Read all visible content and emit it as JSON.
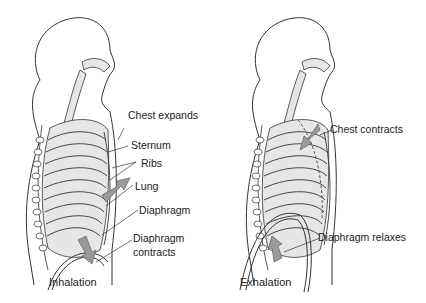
{
  "panels": [
    {
      "caption": "Inhalation",
      "labels": {
        "chest": "Chest expands",
        "sternum": "Sternum",
        "ribs": "Ribs",
        "lung": "Lung",
        "diaphragm": "Diaphragm",
        "diaphragm_action_1": "Diaphragm",
        "diaphragm_action_2": "contracts"
      }
    },
    {
      "caption": "Exhalation",
      "labels": {
        "chest": "Chest contracts",
        "diaphragm_action": "Diaphragm relaxes"
      }
    }
  ],
  "colors": {
    "line": "#333333",
    "fill": "#e6e6e6",
    "arrow": "#9a9a9a"
  }
}
